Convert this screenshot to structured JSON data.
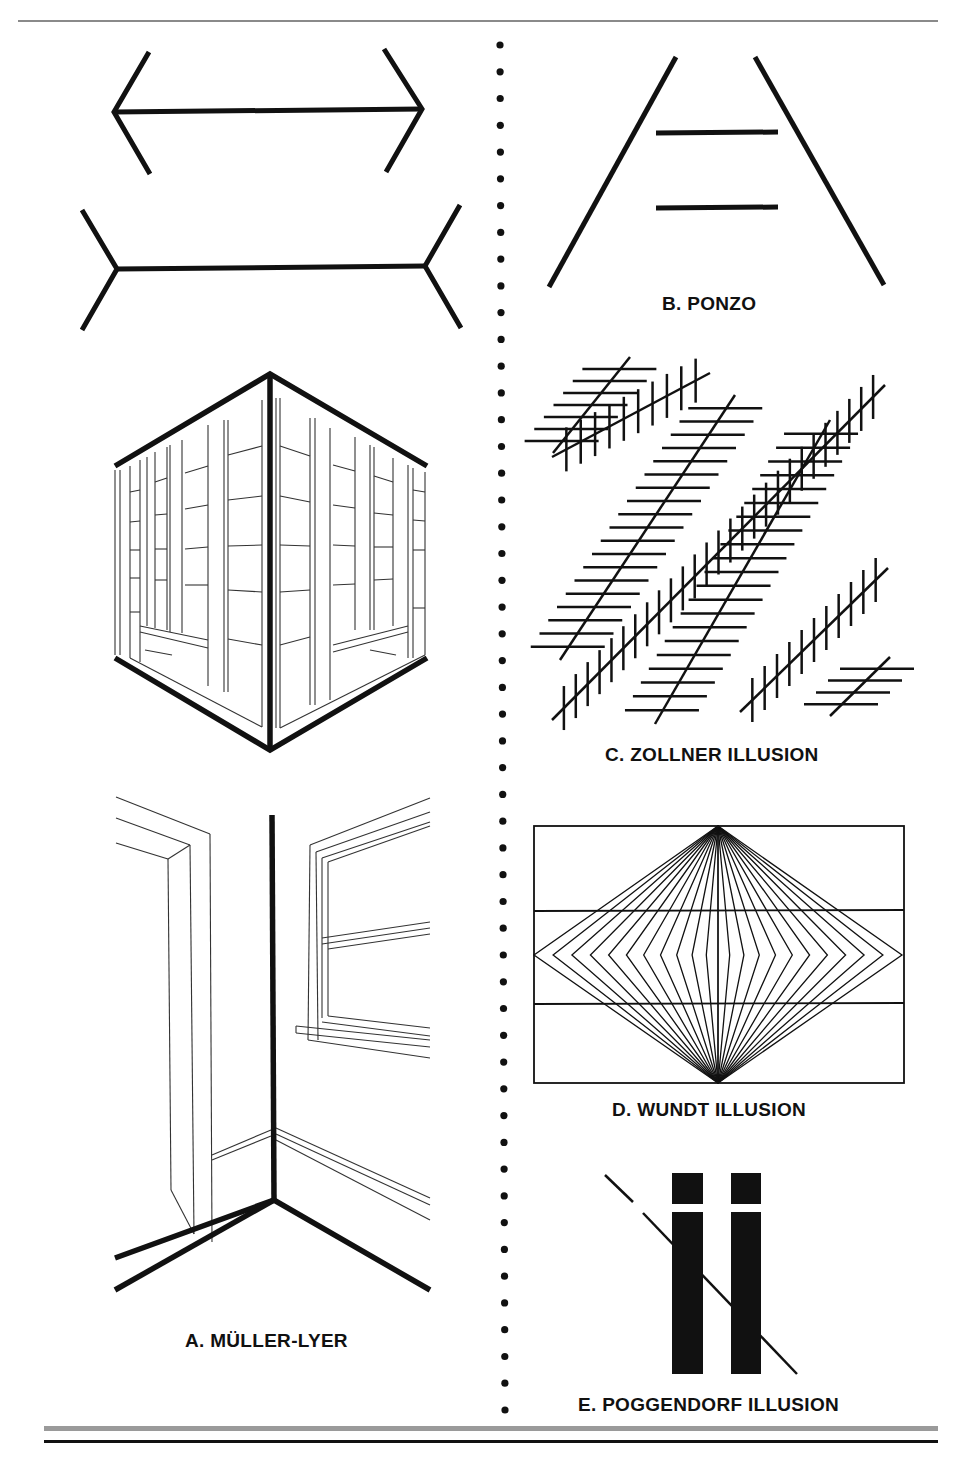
{
  "figures": {
    "a": {
      "label": "A. MÜLLER-LYER",
      "description": "Arrow-head and arrow-tail lines; outside corner of a building and inside corner of a room"
    },
    "b": {
      "label": "B. PONZO",
      "description": "Two equal horizontal bars between converging lines"
    },
    "c": {
      "label": "C. ZOLLNER ILLUSION",
      "description": "Parallel diagonals crossed by short hatch lines"
    },
    "d": {
      "label": "D. WUNDT ILLUSION",
      "description": "Two horizontal parallels crossed by diamond fan of lines"
    },
    "e": {
      "label": "E. POGGENDORF ILLUSION",
      "description": "Diagonal line interrupted by two vertical black bars"
    }
  },
  "divider": {
    "style": "dotted",
    "dot_count": 52
  },
  "colors": {
    "ink": "#111111",
    "rule_gray": "#9a9a9a",
    "background": "#ffffff"
  }
}
